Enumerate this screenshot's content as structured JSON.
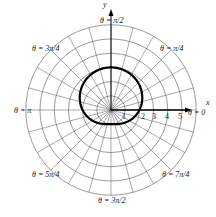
{
  "chart_data": {
    "type": "line",
    "subtype": "polar",
    "title": "",
    "equation": "r = 2 + sin(theta)",
    "r_ticks": [
      "1",
      "2",
      "3",
      "4",
      "5"
    ],
    "rmax": 6,
    "angle_labels": [
      {
        "text": "θ = 0",
        "angle": "0"
      },
      {
        "text": "θ = π/4",
        "angle": "π/4"
      },
      {
        "text": "θ = π/2",
        "angle": "π/2"
      },
      {
        "text": "θ = 3π/4",
        "angle": "3π/4"
      },
      {
        "text": "θ = π",
        "angle": "π"
      },
      {
        "text": "θ = 5π/4",
        "angle": "5π/4"
      },
      {
        "text": "θ = 3π/2",
        "angle": "3π/2"
      },
      {
        "text": "θ = 7π/4",
        "angle": "7π/4"
      }
    ],
    "xlabel": "x",
    "ylabel": "y",
    "points_sample": [
      {
        "theta": 0,
        "r": 2
      },
      {
        "theta": 1.5708,
        "r": 3
      },
      {
        "theta": 3.1416,
        "r": 2
      },
      {
        "theta": 4.7124,
        "r": 1
      }
    ]
  }
}
